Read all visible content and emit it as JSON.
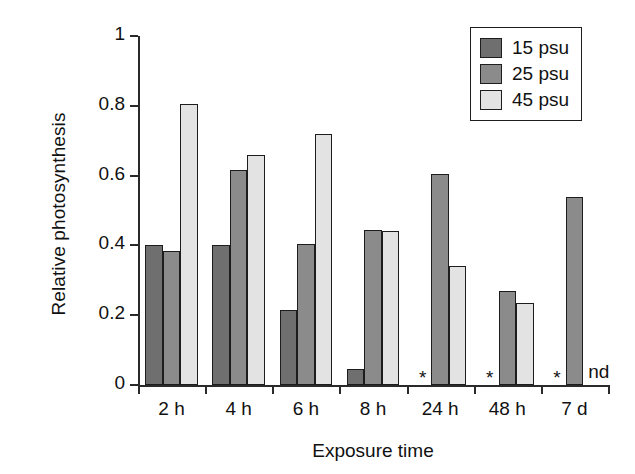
{
  "chart_data": {
    "type": "bar",
    "title": "",
    "xlabel": "Exposure time",
    "ylabel": "Relative photosynthesis",
    "categories": [
      "2 h",
      "4 h",
      "6 h",
      "8 h",
      "24 h",
      "48 h",
      "7 d"
    ],
    "series": [
      {
        "name": "15 psu",
        "color": "#6f6f6f",
        "values": [
          0.4,
          0.4,
          0.215,
          0.045,
          null,
          null,
          null
        ]
      },
      {
        "name": "25 psu",
        "color": "#8b8b8b",
        "values": [
          0.385,
          0.615,
          0.405,
          0.445,
          0.605,
          0.27,
          0.54
        ]
      },
      {
        "name": "45 psu",
        "color": "#e3e3e3",
        "values": [
          0.805,
          0.66,
          0.72,
          0.44,
          0.34,
          0.235,
          null
        ]
      }
    ],
    "ylim": [
      0,
      1
    ],
    "yticks": [
      0,
      0.2,
      0.4,
      0.6,
      0.8,
      1
    ],
    "ytick_labels": [
      "0",
      "0.2",
      "0.4",
      "0.6",
      "0.8",
      "1"
    ],
    "grid": false,
    "legend_position": "top-right",
    "annotations": [
      {
        "text": "*",
        "category": "24 h",
        "series": "15 psu",
        "meaning": "missing-value-marker"
      },
      {
        "text": "*",
        "category": "48 h",
        "series": "15 psu",
        "meaning": "missing-value-marker"
      },
      {
        "text": "*",
        "category": "7 d",
        "series": "15 psu",
        "meaning": "missing-value-marker"
      },
      {
        "text": "nd",
        "category": "7 d",
        "series": "45 psu",
        "meaning": "no-data"
      }
    ]
  },
  "legend": {
    "items": [
      {
        "label": "15 psu",
        "color": "#6f6f6f"
      },
      {
        "label": "25 psu",
        "color": "#8b8b8b"
      },
      {
        "label": "45 psu",
        "color": "#e3e3e3"
      }
    ]
  },
  "axes": {
    "x_title": "Exposure time",
    "y_title": "Relative photosynthesis"
  }
}
